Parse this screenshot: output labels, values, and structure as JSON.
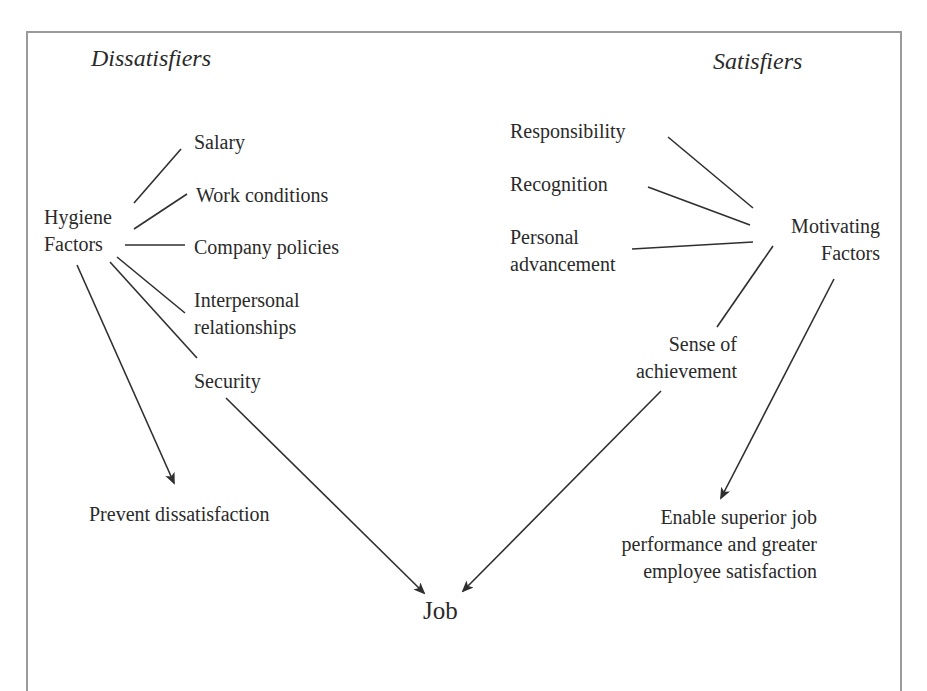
{
  "diagram": {
    "type": "Herzberg two-factor model",
    "headers": {
      "left": "Dissatisfiers",
      "right": "Satisfiers"
    },
    "hygiene": {
      "label_line1": "Hygiene",
      "label_line2": "Factors",
      "items": [
        {
          "line1": "Salary"
        },
        {
          "line1": "Work conditions"
        },
        {
          "line1": "Company policies"
        },
        {
          "line1": "Interpersonal",
          "line2": "relationships"
        },
        {
          "line1": "Security"
        }
      ],
      "outcome": "Prevent dissatisfaction"
    },
    "motivating": {
      "label_line1": "Motivating",
      "label_line2": "Factors",
      "items": [
        {
          "line1": "Responsibility"
        },
        {
          "line1": "Recognition"
        },
        {
          "line1": "Personal",
          "line2": "advancement"
        },
        {
          "line1": "Sense of",
          "line2": "achievement"
        }
      ],
      "outcome_line1": "Enable superior job",
      "outcome_line2": "performance and greater",
      "outcome_line3": "employee satisfaction"
    },
    "center": "Job",
    "colors": {
      "line": "#2f2f2f",
      "frame": "#9a9a9a",
      "text": "#2a2a2a",
      "background": "#ffffff"
    },
    "edges": [
      {
        "from": "Hygiene Factors",
        "to": "Salary",
        "arrow": false
      },
      {
        "from": "Hygiene Factors",
        "to": "Work conditions",
        "arrow": false
      },
      {
        "from": "Hygiene Factors",
        "to": "Company policies",
        "arrow": false
      },
      {
        "from": "Hygiene Factors",
        "to": "Interpersonal relationships",
        "arrow": false
      },
      {
        "from": "Hygiene Factors",
        "to": "Security",
        "arrow": false
      },
      {
        "from": "Hygiene Factors",
        "to": "Prevent dissatisfaction",
        "arrow": true
      },
      {
        "from": "Security",
        "to": "Job",
        "arrow": true
      },
      {
        "from": "Responsibility",
        "to": "Motivating Factors",
        "arrow": false
      },
      {
        "from": "Recognition",
        "to": "Motivating Factors",
        "arrow": false
      },
      {
        "from": "Personal advancement",
        "to": "Motivating Factors",
        "arrow": false
      },
      {
        "from": "Motivating Factors",
        "to": "Sense of achievement",
        "arrow": false
      },
      {
        "from": "Sense of achievement",
        "to": "Job",
        "arrow": true
      },
      {
        "from": "Motivating Factors",
        "to": "Enable superior job performance and greater employee satisfaction",
        "arrow": true
      }
    ]
  }
}
